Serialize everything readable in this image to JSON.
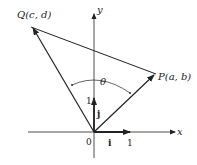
{
  "diagram": {
    "axes": {
      "x_label": "x",
      "y_label": "y",
      "origin_label": "0"
    },
    "points": {
      "P": {
        "label": "P(a, b)"
      },
      "Q": {
        "label": "Q(c, d)"
      }
    },
    "unit_vectors": {
      "i": {
        "label": "i",
        "tick": "1"
      },
      "j": {
        "label": "j",
        "tick": "1"
      }
    },
    "angle": {
      "label": "θ"
    },
    "colors": {
      "stroke": "#222222",
      "background": "#ffffff"
    }
  }
}
